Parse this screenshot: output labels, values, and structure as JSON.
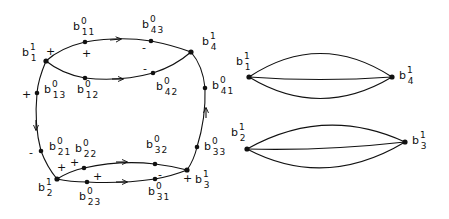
{
  "left_graph": {
    "nodes": [
      {
        "id": "b1_1",
        "base": "b",
        "sup": "1",
        "sub": "1",
        "x": 46,
        "y": 61,
        "lx": 22,
        "ly": 47
      },
      {
        "id": "b11_0",
        "base": "b",
        "sup": "0",
        "sub": "11",
        "x": 85,
        "y": 42,
        "lx": 73,
        "ly": 21
      },
      {
        "id": "b43_0",
        "base": "b",
        "sup": "0",
        "sub": "43",
        "x": 151,
        "y": 41,
        "lx": 142,
        "ly": 19
      },
      {
        "id": "b4_1",
        "base": "b",
        "sup": "1",
        "sub": "4",
        "x": 191,
        "y": 52,
        "lx": 202,
        "ly": 36
      },
      {
        "id": "b12_0",
        "base": "b",
        "sup": "0",
        "sub": "12",
        "x": 85,
        "y": 78,
        "lx": 77,
        "ly": 84
      },
      {
        "id": "b42_0",
        "base": "b",
        "sup": "0",
        "sub": "42",
        "x": 153,
        "y": 73,
        "lx": 156,
        "ly": 81
      },
      {
        "id": "b13_0",
        "base": "b",
        "sup": "0",
        "sub": "13",
        "x": 37,
        "y": 93,
        "lx": 44,
        "ly": 84
      },
      {
        "id": "b41_0",
        "base": "b",
        "sup": "0",
        "sub": "41",
        "x": 205,
        "y": 88,
        "lx": 212,
        "ly": 80
      },
      {
        "id": "b21_0",
        "base": "b",
        "sup": "0",
        "sub": "21",
        "x": 41,
        "y": 151,
        "lx": 49,
        "ly": 141
      },
      {
        "id": "b22_0",
        "base": "b",
        "sup": "0",
        "sub": "22",
        "x": 84,
        "y": 168,
        "lx": 75,
        "ly": 143
      },
      {
        "id": "b2_1",
        "base": "b",
        "sup": "1",
        "sub": "2",
        "x": 57,
        "y": 179,
        "lx": 38,
        "ly": 182
      },
      {
        "id": "b23_0",
        "base": "b",
        "sup": "0",
        "sub": "23",
        "x": 87,
        "y": 182,
        "lx": 79,
        "ly": 191
      },
      {
        "id": "b32_0",
        "base": "b",
        "sup": "0",
        "sub": "32",
        "x": 155,
        "y": 164,
        "lx": 146,
        "ly": 139
      },
      {
        "id": "b31_0",
        "base": "b",
        "sup": "0",
        "sub": "31",
        "x": 155,
        "y": 179,
        "lx": 148,
        "ly": 186
      },
      {
        "id": "b3_1",
        "base": "b",
        "sup": "1",
        "sub": "3",
        "x": 187,
        "y": 170,
        "lx": 195,
        "ly": 174
      },
      {
        "id": "b33_0",
        "base": "b",
        "sup": "0",
        "sub": "33",
        "x": 197,
        "y": 147,
        "lx": 204,
        "ly": 141
      }
    ],
    "signs": [
      {
        "text": "+",
        "x": 46,
        "y": 46
      },
      {
        "text": "+",
        "x": 82,
        "y": 48
      },
      {
        "text": "-",
        "x": 142,
        "y": 42
      },
      {
        "text": "-",
        "x": 143,
        "y": 63
      },
      {
        "text": "+",
        "x": 22,
        "y": 89
      },
      {
        "text": "-",
        "x": 29,
        "y": 147
      },
      {
        "text": "+",
        "x": 57,
        "y": 162
      },
      {
        "text": "+",
        "x": 70,
        "y": 157
      },
      {
        "text": "+",
        "x": 93,
        "y": 171
      },
      {
        "text": "-",
        "x": 158,
        "y": 169
      },
      {
        "text": "+",
        "x": 183,
        "y": 173
      }
    ]
  },
  "right_graphs": [
    {
      "left": {
        "base": "b",
        "sup": "1",
        "sub": "1",
        "x": 249,
        "y": 77,
        "lx": 236,
        "ly": 56
      },
      "right": {
        "base": "b",
        "sup": "1",
        "sub": "4",
        "x": 392,
        "y": 77,
        "lx": 399,
        "ly": 70
      }
    },
    {
      "left": {
        "base": "b",
        "sup": "1",
        "sub": "2",
        "x": 247,
        "y": 149,
        "lx": 231,
        "ly": 127
      },
      "right": {
        "base": "b",
        "sup": "1",
        "sub": "3",
        "x": 405,
        "y": 142,
        "lx": 412,
        "ly": 135
      }
    }
  ]
}
